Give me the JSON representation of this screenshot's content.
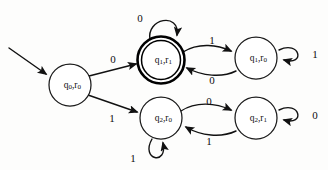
{
  "diagram": {
    "kind": "finite-state-automaton",
    "title": "",
    "alphabet": [
      "0",
      "1"
    ],
    "start_state_id": "q0r0",
    "accepting_state_ids": [
      "q1r1"
    ],
    "states": [
      {
        "id": "q0r0",
        "label": "q0,r0",
        "label_main_1": "q",
        "label_sub_1": "0",
        "label_mid": ",r",
        "label_sub_2": "0",
        "cx": 70,
        "cy": 85,
        "r": 21,
        "accepting": false,
        "is_start": true
      },
      {
        "id": "q1r1",
        "label": "q1,r1",
        "label_main_1": "q",
        "label_sub_1": "1",
        "label_mid": ",r",
        "label_sub_2": "1",
        "cx": 161,
        "cy": 60,
        "r": 22,
        "accepting": true,
        "is_start": false
      },
      {
        "id": "q1r0",
        "label": "q1,r0",
        "label_main_1": "q",
        "label_sub_1": "1",
        "label_mid": ",r",
        "label_sub_2": "0",
        "cx": 256,
        "cy": 58,
        "r": 21,
        "accepting": false,
        "is_start": false
      },
      {
        "id": "q2r0",
        "label": "q2,r0",
        "label_main_1": "q",
        "label_sub_1": "2",
        "label_mid": ",r",
        "label_sub_2": "0",
        "cx": 161,
        "cy": 118,
        "r": 21,
        "accepting": false,
        "is_start": false
      },
      {
        "id": "q2r1",
        "label": "q2,r1",
        "label_main_1": "q",
        "label_sub_1": "2",
        "label_mid": ",r",
        "label_sub_2": "1",
        "cx": 256,
        "cy": 118,
        "r": 21,
        "accepting": false,
        "is_start": false
      }
    ],
    "transitions": [
      {
        "id": "t-start",
        "from": "",
        "to": "q0r0",
        "symbol": "",
        "label_x": 0,
        "label_y": 0
      },
      {
        "id": "t-q0r0-q1r1",
        "from": "q0r0",
        "to": "q1r1",
        "symbol": "0",
        "label_x": 113,
        "label_y": 59
      },
      {
        "id": "t-q0r0-q2r0",
        "from": "q0r0",
        "to": "q2r0",
        "symbol": "1",
        "label_x": 112,
        "label_y": 118
      },
      {
        "id": "t-q1r1-self",
        "from": "q1r1",
        "to": "q1r1",
        "symbol": "0",
        "label_x": 140,
        "label_y": 18
      },
      {
        "id": "t-q1r1-q1r0",
        "from": "q1r1",
        "to": "q1r0",
        "symbol": "1",
        "label_x": 212,
        "label_y": 40
      },
      {
        "id": "t-q1r0-q1r1",
        "from": "q1r0",
        "to": "q1r1",
        "symbol": "0",
        "label_x": 212,
        "label_y": 80
      },
      {
        "id": "t-q1r0-self",
        "from": "q1r0",
        "to": "q1r0",
        "symbol": "1",
        "label_x": 315,
        "label_y": 54
      },
      {
        "id": "t-q2r0-q2r1",
        "from": "q2r0",
        "to": "q2r1",
        "symbol": "0",
        "label_x": 209,
        "label_y": 101
      },
      {
        "id": "t-q2r1-q2r0",
        "from": "q2r1",
        "to": "q2r0",
        "symbol": "1",
        "label_x": 209,
        "label_y": 141
      },
      {
        "id": "t-q2r0-self",
        "from": "q2r0",
        "to": "q2r0",
        "symbol": "1",
        "label_x": 133,
        "label_y": 158
      },
      {
        "id": "t-q2r1-self",
        "from": "q2r1",
        "to": "q2r1",
        "symbol": "0",
        "label_x": 315,
        "label_y": 115
      }
    ],
    "colors": {
      "ink": "#111111",
      "background": "#fdfdfc",
      "state_fill": "#ffffff"
    }
  }
}
